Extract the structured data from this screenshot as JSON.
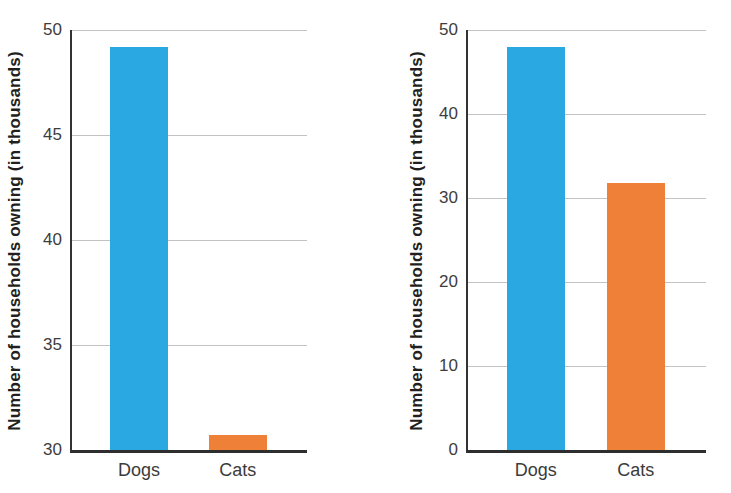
{
  "figure": {
    "description_left_panel": "bar chart with truncated y-axis starting at 30",
    "description_right_panel": "bar chart with full y-axis starting at 0",
    "ylabel": "Number of households owning (in thousands)",
    "palette": {
      "dogs_bar": "#2AA8E2",
      "cats_bar": "#EE8038",
      "axis": "#333333",
      "gridline": "#c3c3c3",
      "tick_text": "#3d3d3d",
      "axis_title_text": "#231f20"
    }
  },
  "chart_data": [
    {
      "type": "bar",
      "title": "",
      "categories": [
        "Dogs",
        "Cats"
      ],
      "values": [
        49.2,
        30.7
      ],
      "bar_colors": [
        "#2AA8E2",
        "#EE8038"
      ],
      "xlabel": "",
      "ylabel": "Number of households owning (in thousands)",
      "ylim": [
        30,
        50
      ],
      "yticks": [
        30,
        35,
        40,
        45,
        50
      ],
      "grid": true,
      "legend": false
    },
    {
      "type": "bar",
      "title": "",
      "categories": [
        "Dogs",
        "Cats"
      ],
      "values": [
        48,
        31.8
      ],
      "bar_colors": [
        "#2AA8E2",
        "#EE8038"
      ],
      "xlabel": "",
      "ylabel": "Number of households owning (in thousands)",
      "ylim": [
        0,
        50
      ],
      "yticks": [
        0,
        10,
        20,
        30,
        40,
        50
      ],
      "grid": true,
      "legend": false
    }
  ]
}
